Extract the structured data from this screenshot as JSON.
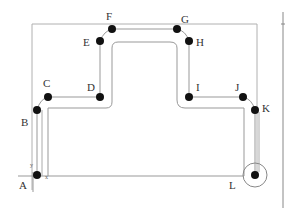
{
  "diagram": {
    "type": "toolpath",
    "colors": {
      "path": "#999999",
      "frame": "#aaaaaa",
      "point": "#111111",
      "label": "#333333"
    },
    "points": [
      {
        "id": "A",
        "label": "A",
        "x": 37,
        "y": 176
      },
      {
        "id": "B",
        "label": "B",
        "x": 37,
        "y": 110
      },
      {
        "id": "C",
        "label": "C",
        "x": 48,
        "y": 97
      },
      {
        "id": "D",
        "label": "D",
        "x": 100,
        "y": 97
      },
      {
        "id": "E",
        "label": "E",
        "x": 100,
        "y": 41
      },
      {
        "id": "F",
        "label": "F",
        "x": 112,
        "y": 29
      },
      {
        "id": "G",
        "label": "G",
        "x": 177,
        "y": 29
      },
      {
        "id": "H",
        "label": "H",
        "x": 189,
        "y": 41
      },
      {
        "id": "I",
        "label": "I",
        "x": 189,
        "y": 97
      },
      {
        "id": "J",
        "label": "J",
        "x": 243,
        "y": 97
      },
      {
        "id": "K",
        "label": "K",
        "x": 255,
        "y": 110
      },
      {
        "id": "L",
        "label": "L",
        "x": 255,
        "y": 176
      }
    ],
    "axes": {
      "y_label": "y",
      "x_label": "x"
    }
  }
}
